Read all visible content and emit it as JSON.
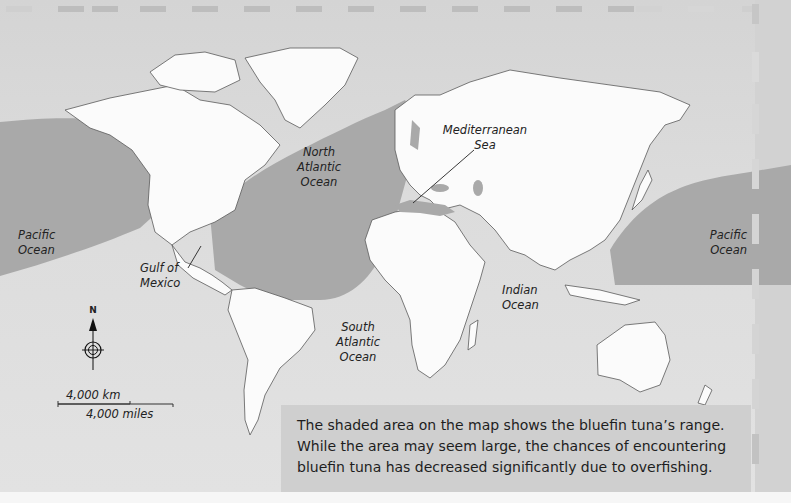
{
  "map": {
    "title": "Bluefin tuna range",
    "ocean_labels": {
      "north_atlantic": [
        "North",
        "Atlantic",
        "Ocean"
      ],
      "mediterranean": [
        "Mediterranean",
        "Sea"
      ],
      "pacific_west": [
        "Pacific",
        "Ocean"
      ],
      "pacific_east": [
        "Pacific",
        "Ocean"
      ],
      "gulf_of_mexico": [
        "Gulf of",
        "Mexico"
      ],
      "indian": [
        "Indian",
        "Ocean"
      ],
      "south_atlantic": [
        "South",
        "Atlantic",
        "Ocean"
      ]
    },
    "compass": {
      "label": "N",
      "icon": "compass-rose-icon"
    },
    "scale": {
      "km_label": "4,000 km",
      "miles_label": "4,000 miles"
    },
    "colors": {
      "ocean": "#dcdcdc",
      "land": "#fbfbfb",
      "range_shading": "#a9a9a9",
      "border": "#5a5a5a",
      "caption_bg": "#cfcfcf"
    },
    "legend": {
      "shaded_area_meaning": "bluefin tuna range"
    }
  },
  "caption": {
    "lines": [
      "The shaded area on the map shows the bluefin tuna’s range.",
      "While the area may seem large, the chances of encountering",
      "bluefin tuna has decreased significantly due to overfishing."
    ]
  }
}
